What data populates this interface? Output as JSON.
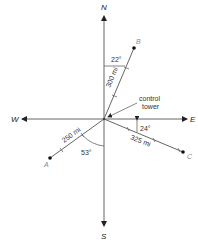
{
  "diagram": {
    "type": "compass-bearing-diagram",
    "directions": {
      "north": "N",
      "south": "S",
      "east": "E",
      "west": "W"
    },
    "origin_label_line1": "control",
    "origin_label_line2": "tower",
    "points": [
      {
        "name": "B",
        "distance_label": "300 mi",
        "angle_label": "22°",
        "angle_reference": "from North toward East"
      },
      {
        "name": "A",
        "distance_label": "250 mi",
        "angle_label": "53°",
        "angle_reference": "from South toward West"
      },
      {
        "name": "C",
        "distance_label": "325 mi",
        "angle_label": "24°",
        "angle_reference": "from East toward South"
      }
    ],
    "colors": {
      "line": "#555555",
      "text": "#222222",
      "point_label": "#888888"
    }
  }
}
